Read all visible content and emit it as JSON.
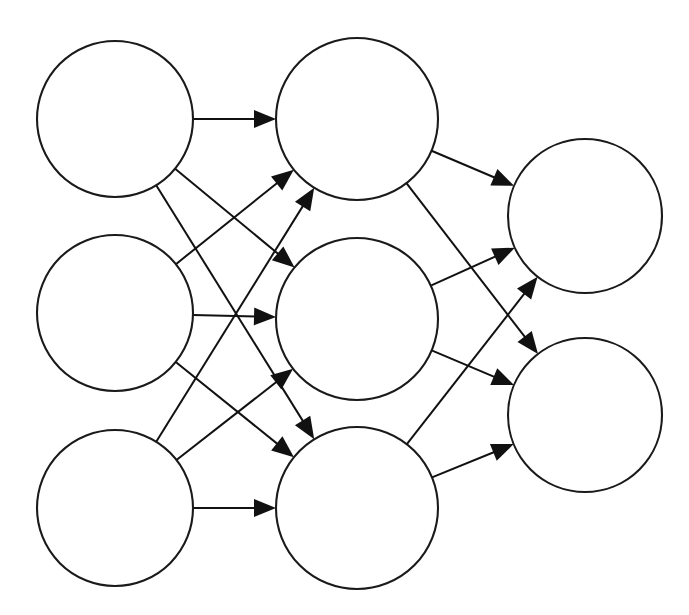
{
  "diagram": {
    "type": "neural-network-graph",
    "background_color": "#ffffff",
    "stroke_color": "#111111",
    "node_fill_color": "#ffffff",
    "node_stroke_width": 2.1,
    "edge_stroke_width": 2.0,
    "canvas": {
      "width": 689,
      "height": 615
    }
  },
  "chart_data": {
    "type": "diagram",
    "layers": [
      {
        "name": "input-layer",
        "index": 0,
        "node_count": 3,
        "nodes": [
          {
            "id": "i1",
            "label": "",
            "cx": 115,
            "cy": 119,
            "r": 78
          },
          {
            "id": "i2",
            "label": "",
            "cx": 115,
            "cy": 313,
            "r": 78
          },
          {
            "id": "i3",
            "label": "",
            "cx": 115,
            "cy": 508,
            "r": 78
          }
        ]
      },
      {
        "name": "hidden-layer",
        "index": 1,
        "node_count": 3,
        "nodes": [
          {
            "id": "h1",
            "label": "",
            "cx": 357,
            "cy": 119,
            "r": 81
          },
          {
            "id": "h2",
            "label": "",
            "cx": 357,
            "cy": 319,
            "r": 81
          },
          {
            "id": "h3",
            "label": "",
            "cx": 357,
            "cy": 508,
            "r": 81
          }
        ]
      },
      {
        "name": "output-layer",
        "index": 2,
        "node_count": 2,
        "nodes": [
          {
            "id": "o1",
            "label": "",
            "cx": 585,
            "cy": 216,
            "r": 77
          },
          {
            "id": "o2",
            "label": "",
            "cx": 585,
            "cy": 415,
            "r": 77
          }
        ]
      }
    ],
    "edges": [
      {
        "from": "i1",
        "to": "h1"
      },
      {
        "from": "i1",
        "to": "h2"
      },
      {
        "from": "i1",
        "to": "h3"
      },
      {
        "from": "i2",
        "to": "h1"
      },
      {
        "from": "i2",
        "to": "h2"
      },
      {
        "from": "i2",
        "to": "h3"
      },
      {
        "from": "i3",
        "to": "h1"
      },
      {
        "from": "i3",
        "to": "h2"
      },
      {
        "from": "i3",
        "to": "h3"
      },
      {
        "from": "h1",
        "to": "o1"
      },
      {
        "from": "h1",
        "to": "o2"
      },
      {
        "from": "h2",
        "to": "o1"
      },
      {
        "from": "h2",
        "to": "o2"
      },
      {
        "from": "h3",
        "to": "o1"
      },
      {
        "from": "h3",
        "to": "o2"
      }
    ],
    "edge_count": 15,
    "node_count": 8,
    "directed": true,
    "arrowhead_style": "solid-triangle",
    "legend": [],
    "annotations": []
  }
}
